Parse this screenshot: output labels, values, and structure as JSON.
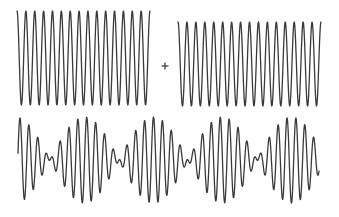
{
  "figure": {
    "title": "",
    "stroke_color": "#3a3a3a",
    "background": "#ffffff",
    "operator_symbol": "+",
    "waves": [
      {
        "id": "wave-1",
        "label": "",
        "x_start": 17,
        "x_end": 150,
        "y_center": 58,
        "amplitude": 47,
        "periods": 15,
        "phase": "starts-at-peak"
      },
      {
        "id": "wave-2",
        "label": "",
        "x_start": 178,
        "x_end": 321,
        "y_center": 64,
        "amplitude": 42,
        "periods": 16,
        "phase": "starts-at-peak"
      },
      {
        "id": "sum-wave",
        "label": "",
        "x_start": 18,
        "x_end": 319,
        "y_center": 160,
        "amplitude": 43,
        "carrier_period_px": 8.9,
        "carrier_peak_x": 20,
        "envelope_period_px": 69,
        "envelope_max_x": 15.5,
        "envelope_nodes_x": [
          50,
          118,
          188,
          257
        ]
      }
    ],
    "plus_position": {
      "x": 165,
      "y": 66,
      "size": 7
    }
  }
}
